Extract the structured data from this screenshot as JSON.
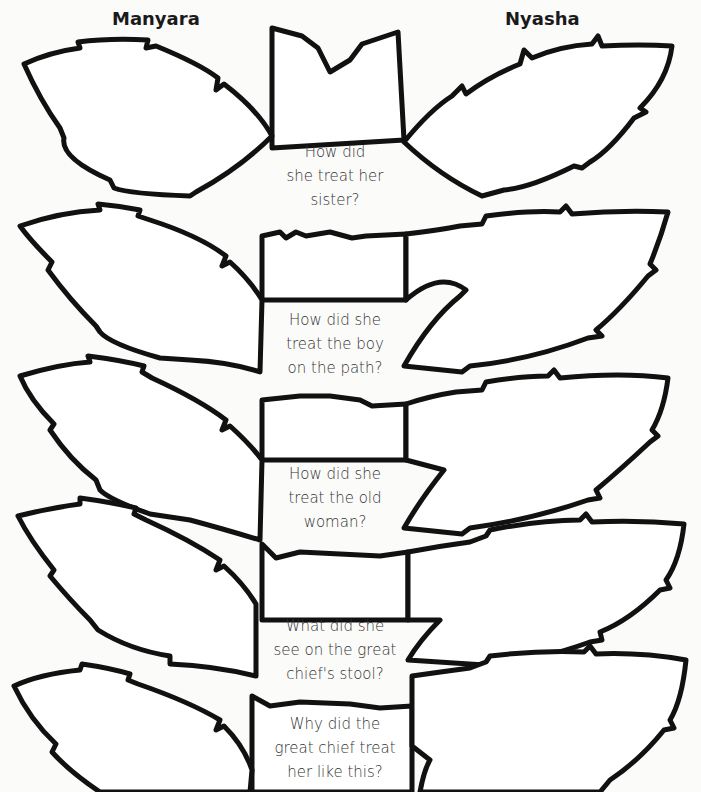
{
  "header": {
    "left_name": "Manyara",
    "right_name": "Nyasha"
  },
  "rows": [
    {
      "question_lines": [
        "How did",
        "she treat her",
        "sister?"
      ]
    },
    {
      "question_lines": [
        "How did she",
        "treat the boy",
        "on the path?"
      ]
    },
    {
      "question_lines": [
        "How did she",
        "treat the old",
        "woman?"
      ]
    },
    {
      "question_lines": [
        "What did she",
        "see on the great",
        "chief's stool?"
      ]
    },
    {
      "question_lines": [
        "Why did the",
        "great chief treat",
        "her like this?"
      ]
    }
  ],
  "colors": {
    "outline": "#111111",
    "text": "#333333",
    "background": "#fbfbfa"
  }
}
